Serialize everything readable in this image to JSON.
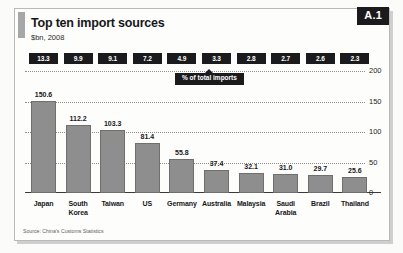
{
  "figure": {
    "id_badge": "A.1",
    "title": "Top ten import sources",
    "subtitle": "$bn, 2008",
    "callout_label": "% of total imports",
    "source": "Source: China's Customs Statistics"
  },
  "colors": {
    "bar_fill": "#8e8e8e",
    "bar_stroke": "#6f6f6f",
    "chip_bg": "#1b1b1d",
    "chip_text": "#ffffff",
    "accent": "#a7a7a7",
    "frame": "#b9b9b9"
  },
  "chart_data": {
    "type": "bar",
    "title": "Top ten import sources",
    "subtitle": "$bn, 2008",
    "xlabel": "",
    "ylabel": "$bn",
    "ylim": [
      0,
      200
    ],
    "yticks": [
      "0",
      "50",
      "100",
      "150",
      "200"
    ],
    "ytick_values": [
      0,
      50,
      100,
      150,
      200
    ],
    "grid": true,
    "grid_style": "dotted",
    "axis_position": "right",
    "legend": false,
    "annotation": "% of total imports",
    "categories": [
      "Japan",
      "South Korea",
      "Taiwan",
      "US",
      "Germany",
      "Australia",
      "Malaysia",
      "Saudi Arabia",
      "Brazil",
      "Thailand"
    ],
    "values": [
      150.6,
      112.2,
      103.3,
      81.4,
      55.8,
      37.4,
      32.1,
      31.0,
      29.7,
      25.6
    ],
    "value_labels": [
      "150.6",
      "112.2",
      "103.3",
      "81.4",
      "55.8",
      "37.4",
      "32.1",
      "31.0",
      "29.7",
      "25.6"
    ],
    "secondary_series": {
      "name": "% of total imports",
      "unit": "%",
      "values": [
        13.3,
        9.9,
        9.1,
        7.2,
        4.9,
        3.3,
        2.8,
        2.7,
        2.6,
        2.3
      ],
      "labels": [
        "13.3",
        "9.9",
        "9.1",
        "7.2",
        "4.9",
        "3.3",
        "2.8",
        "2.7",
        "2.6",
        "2.3"
      ]
    }
  }
}
